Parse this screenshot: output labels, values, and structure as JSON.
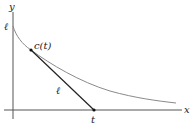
{
  "diagram": {
    "axes": {
      "x_label": "x",
      "y_label": "y"
    },
    "labels": {
      "y_intercept": "ℓ",
      "point": "c(t)",
      "segment": "ℓ",
      "x_point": "t"
    },
    "colors": {
      "axis": "#555555",
      "curve": "#8a8a8a",
      "segment": "#222222"
    }
  }
}
